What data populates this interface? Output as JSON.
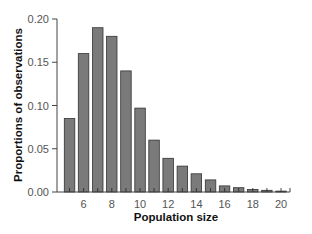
{
  "chart_data": {
    "type": "bar",
    "title": "",
    "xlabel": "Population size",
    "ylabel": "Proportions of observations",
    "categories": [
      5,
      6,
      7,
      8,
      9,
      10,
      11,
      12,
      13,
      14,
      15,
      16,
      17,
      18,
      19,
      20
    ],
    "values": [
      0.085,
      0.16,
      0.19,
      0.18,
      0.14,
      0.097,
      0.06,
      0.039,
      0.03,
      0.021,
      0.014,
      0.007,
      0.005,
      0.003,
      0.002,
      0.001
    ],
    "xticks": [
      "6",
      "8",
      "10",
      "12",
      "14",
      "16",
      "18",
      "20"
    ],
    "yticks": [
      "0.00",
      "0.05",
      "0.10",
      "0.15",
      "0.20"
    ],
    "ylim": [
      0,
      0.2
    ],
    "xlim": [
      4.4,
      21
    ],
    "grid": false,
    "legend": null,
    "bar_color": "#7a7a7a",
    "bar_edge_color": "#333333"
  }
}
